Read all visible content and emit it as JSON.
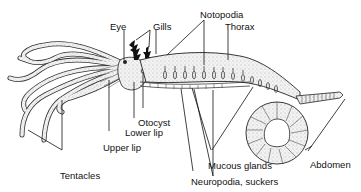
{
  "diagram": {
    "type": "anatomical-illustration",
    "labels": {
      "eye": "Eye",
      "gills": "Gills",
      "notopodia": "Notopodia",
      "thorax": "Thorax",
      "otocyst": "Otocyst",
      "lower_lip": "Lower lip",
      "upper_lip": "Upper lip",
      "tentacles": "Tentacles",
      "mucous_glands": "Mucous glands",
      "abdomen": "Abdomen",
      "neuropodia_suckers": "Neuropodia, suckers"
    },
    "colors": {
      "ink": "#111111",
      "body_fill": "#e6e6e6",
      "background": "#ffffff"
    }
  }
}
